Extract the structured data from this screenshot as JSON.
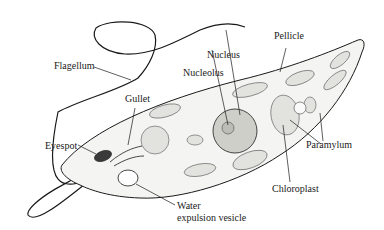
{
  "diagram": {
    "labels": {
      "flagellum": "Flagellum",
      "nucleus": "Nucleus",
      "nucleolus": "Nucleolus",
      "pellicle": "Pellicle",
      "gullet": "Gullet",
      "eyespot": "Eyespot",
      "paramylum": "Paramylum",
      "chloroplast": "Chloroplast",
      "water_line1": "Water",
      "water_line2": "expulsion vesicle"
    },
    "colors": {
      "ink": "#1a1a1a",
      "body_fill": "#f4f4f2",
      "organelle_fill": "#e2e2de",
      "nucleus_fill": "#cfcfca",
      "eyespot_fill": "#3a3a3a",
      "background": "#ffffff"
    }
  }
}
